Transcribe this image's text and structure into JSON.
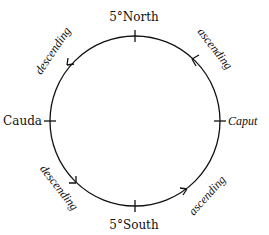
{
  "diagram": {
    "points": {
      "top": "5°North",
      "bottom": "5°South",
      "left": "Cauda",
      "right": "Caput"
    },
    "arcs": {
      "upper_left": "descending",
      "upper_right": "ascending",
      "lower_left": "descending",
      "lower_right": "ascending"
    },
    "colors": {
      "line": "#111111",
      "background": "#ffffff"
    }
  }
}
